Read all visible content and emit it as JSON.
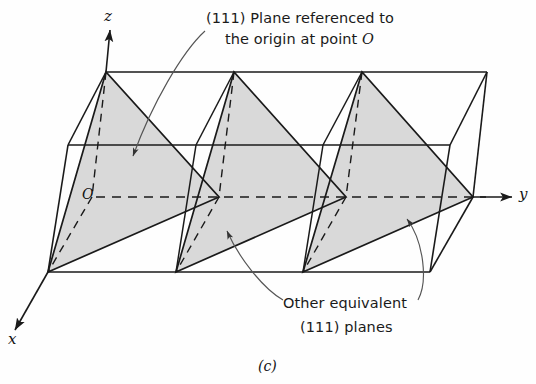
{
  "figure": {
    "caption": "(c)",
    "shade_color": "#d9d9d9",
    "line_color": "#1a1a1a",
    "background": "#fefefe"
  },
  "axes": {
    "z_label": "z",
    "y_label": "y",
    "x_label": "x",
    "origin_label": "O"
  },
  "annotations": {
    "top": {
      "line1": "(111) Plane referenced to",
      "line2_prefix": "the origin at point ",
      "line2_italic": "O"
    },
    "bottom": {
      "line1": "Other equivalent",
      "line2": "(111) planes"
    }
  },
  "diagram": {
    "type": "crystallographic-unit-cells",
    "cell_count": 3,
    "plane_indices": "(111)",
    "shaded_plane_count": 3
  }
}
